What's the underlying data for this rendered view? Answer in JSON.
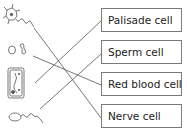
{
  "diagram": {
    "type": "matching",
    "labels": [
      {
        "text": "Palisade cell"
      },
      {
        "text": "Sperm cell"
      },
      {
        "text": "Red blood cell"
      },
      {
        "text": "Nerve cell"
      }
    ],
    "pictures": [
      {
        "depicts": "nerve-cell"
      },
      {
        "depicts": "red-blood-cell"
      },
      {
        "depicts": "palisade-cell"
      },
      {
        "depicts": "sperm-cell"
      }
    ],
    "connections": [
      {
        "from": "nerve-cell",
        "to": "Nerve cell"
      },
      {
        "from": "red-blood-cell",
        "to": "Red blood cell"
      },
      {
        "from": "palisade-cell",
        "to": "Palisade cell"
      },
      {
        "from": "sperm-cell",
        "to": "Sperm cell"
      }
    ],
    "line_color": "#555555",
    "box_border_color": "#7a7a7a"
  }
}
